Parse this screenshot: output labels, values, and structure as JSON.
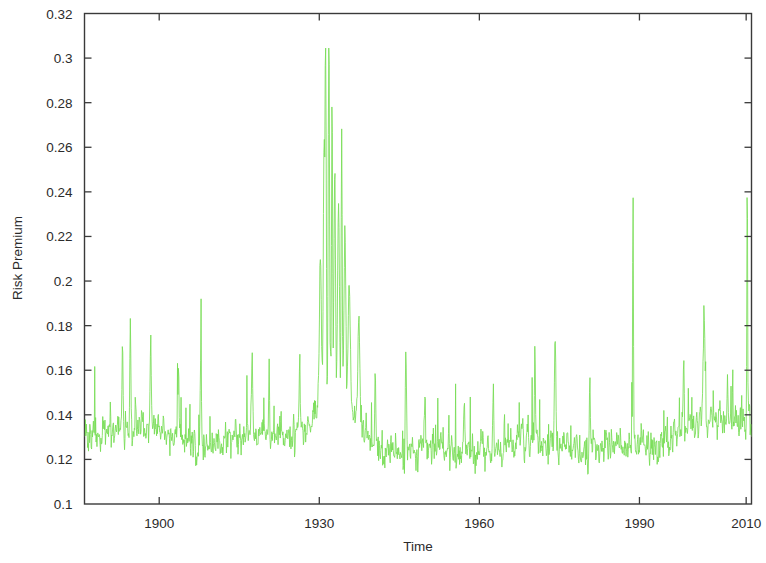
{
  "chart_data": {
    "type": "line",
    "title": "",
    "xlabel": "Time",
    "ylabel": "Risk Premium",
    "xlim": [
      1886,
      2011
    ],
    "ylim": [
      0.1,
      0.32
    ],
    "grid": false,
    "legend": null,
    "line_color": "#77dd55",
    "xticks": [
      1900,
      1930,
      1960,
      1990,
      2010
    ],
    "xtick_labels": [
      "1900",
      "1930",
      "1960",
      "1990",
      "2010"
    ],
    "yticks": [
      0.1,
      0.12,
      0.14,
      0.16,
      0.18,
      0.2,
      0.22,
      0.24,
      0.26,
      0.28,
      0.3,
      0.32
    ],
    "ytick_labels": [
      "0.1",
      "0.12",
      "0.14",
      "0.16",
      "0.18",
      "0.2",
      "0.22",
      "0.24",
      "0.26",
      "0.28",
      "0.3",
      "0.32"
    ],
    "series": [
      {
        "name": "Risk Premium",
        "x_start": 1886,
        "x_end": 2011,
        "n_points": 1500,
        "baseline_mean": 0.127,
        "baseline_noise": 0.008,
        "peak_events": [
          {
            "year": 1931.8,
            "value": 0.304,
            "width": 0.35
          },
          {
            "year": 1931.2,
            "value": 0.288,
            "width": 0.3
          },
          {
            "year": 1932.4,
            "value": 0.268,
            "width": 0.3
          },
          {
            "year": 1930.9,
            "value": 0.246,
            "width": 0.4
          },
          {
            "year": 1932.9,
            "value": 0.232,
            "width": 0.4
          },
          {
            "year": 1934.2,
            "value": 0.245,
            "width": 0.3
          },
          {
            "year": 1933.6,
            "value": 0.218,
            "width": 0.5
          },
          {
            "year": 1934.8,
            "value": 0.205,
            "width": 0.5
          },
          {
            "year": 1930.2,
            "value": 0.192,
            "width": 0.6
          },
          {
            "year": 1935.6,
            "value": 0.178,
            "width": 0.7
          },
          {
            "year": 1937.4,
            "value": 0.172,
            "width": 0.6
          },
          {
            "year": 1988.8,
            "value": 0.24,
            "width": 0.22
          },
          {
            "year": 2010.2,
            "value": 0.238,
            "width": 0.22
          },
          {
            "year": 1974.2,
            "value": 0.181,
            "width": 0.4
          },
          {
            "year": 2002.1,
            "value": 0.176,
            "width": 0.5
          },
          {
            "year": 1946.2,
            "value": 0.172,
            "width": 0.3
          },
          {
            "year": 1894.6,
            "value": 0.172,
            "width": 0.3
          },
          {
            "year": 1898.4,
            "value": 0.168,
            "width": 0.3
          },
          {
            "year": 1893.1,
            "value": 0.163,
            "width": 0.3
          },
          {
            "year": 1903.6,
            "value": 0.16,
            "width": 0.3
          },
          {
            "year": 1907.8,
            "value": 0.166,
            "width": 0.3
          },
          {
            "year": 1917.4,
            "value": 0.16,
            "width": 0.3
          },
          {
            "year": 1920.6,
            "value": 0.158,
            "width": 0.3
          },
          {
            "year": 1926.3,
            "value": 0.157,
            "width": 0.3
          },
          {
            "year": 1940.5,
            "value": 0.162,
            "width": 0.3
          },
          {
            "year": 1949.8,
            "value": 0.155,
            "width": 0.3
          },
          {
            "year": 1957.2,
            "value": 0.152,
            "width": 0.3
          },
          {
            "year": 1962.6,
            "value": 0.156,
            "width": 0.3
          },
          {
            "year": 1970.4,
            "value": 0.163,
            "width": 0.3
          },
          {
            "year": 1980.7,
            "value": 0.158,
            "width": 0.3
          },
          {
            "year": 1998.3,
            "value": 0.156,
            "width": 0.3
          },
          {
            "year": 2006.5,
            "value": 0.15,
            "width": 0.3
          }
        ]
      }
    ]
  },
  "axes": {
    "ylabel": "Risk Premium",
    "xlabel": "Time"
  }
}
